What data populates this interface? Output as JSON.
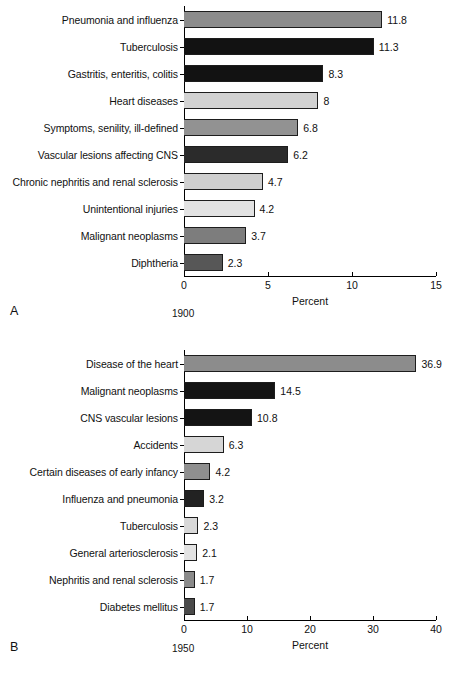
{
  "figure": {
    "panels": [
      {
        "letter": "A",
        "year": "1900",
        "axis_title": "Percent"
      },
      {
        "letter": "B",
        "year": "1950",
        "axis_title": "Percent"
      }
    ]
  },
  "chart_data": [
    {
      "type": "bar",
      "orientation": "horizontal",
      "title": "1900",
      "panel": "A",
      "xlabel": "Percent",
      "ylabel": "",
      "xlim": [
        0,
        15
      ],
      "xticks": [
        0,
        5,
        10,
        15
      ],
      "xticklabels": [
        "0",
        "5",
        "10",
        "15"
      ],
      "grid": false,
      "legend": "none",
      "categories": [
        "Pneumonia and influenza",
        "Tuberculosis",
        "Gastritis, enteritis, colitis",
        "Heart diseases",
        "Symptoms, senility, ill-defined",
        "Vascular lesions affecting CNS",
        "Chronic nephritis and renal sclerosis",
        "Unintentional injuries",
        "Malignant neoplasms",
        "Diphtheria"
      ],
      "values": [
        11.8,
        11.3,
        8.3,
        8,
        6.8,
        6.2,
        4.7,
        4.2,
        3.7,
        2.3
      ],
      "value_labels": [
        "11.8",
        "11.3",
        "8.3",
        "8",
        "6.8",
        "6.2",
        "4.7",
        "4.2",
        "3.7",
        "2.3"
      ],
      "bar_colors": [
        "#8c8c8c",
        "#121212",
        "#121212",
        "#d2d2d2",
        "#929292",
        "#2b2b2b",
        "#cfcfcf",
        "#e2e2e2",
        "#7d7d7d",
        "#575757"
      ]
    },
    {
      "type": "bar",
      "orientation": "horizontal",
      "title": "1950",
      "panel": "B",
      "xlabel": "Percent",
      "ylabel": "",
      "xlim": [
        0,
        40
      ],
      "xticks": [
        0,
        10,
        20,
        30,
        40
      ],
      "xticklabels": [
        "0",
        "10",
        "20",
        "30",
        "40"
      ],
      "grid": false,
      "legend": "none",
      "categories": [
        "Disease of the heart",
        "Malignant neoplasms",
        "CNS vascular lesions",
        "Accidents",
        "Certain diseases of early infancy",
        "Influenza and pneumonia",
        "Tuberculosis",
        "General arteriosclerosis",
        "Nephritis and renal sclerosis",
        "Diabetes mellitus"
      ],
      "values": [
        36.9,
        14.5,
        10.8,
        6.3,
        4.2,
        3.2,
        2.3,
        2.1,
        1.7,
        1.7
      ],
      "value_labels": [
        "36.9",
        "14.5",
        "10.8",
        "6.3",
        "4.2",
        "3.2",
        "2.3",
        "2.1",
        "1.7",
        "1.7"
      ],
      "bar_colors": [
        "#8c8c8c",
        "#141414",
        "#141414",
        "#d6d6d6",
        "#8f8f8f",
        "#222222",
        "#d8d8d8",
        "#e3e3e3",
        "#8a8a8a",
        "#4a4a4a"
      ]
    }
  ]
}
